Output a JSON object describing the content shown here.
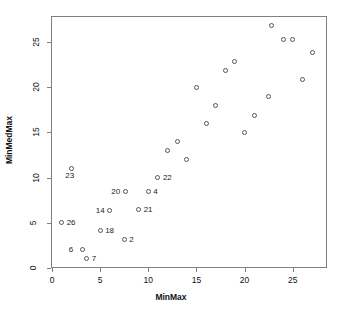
{
  "chart_data": {
    "type": "scatter",
    "title": "",
    "xlabel": "MinMax",
    "ylabel": "MinMedMax",
    "xlim": [
      -0.4,
      28.3
    ],
    "ylim": [
      -0.5,
      27.5
    ],
    "xticks": [
      0,
      5,
      10,
      15,
      20,
      25
    ],
    "yticks": [
      0,
      5,
      10,
      15,
      20,
      25
    ],
    "grid": false,
    "legend": null,
    "marker": "open-circle",
    "points": [
      {
        "x": 1.0,
        "y": 5.0,
        "label": "26",
        "label_pos": "right"
      },
      {
        "x": 2.0,
        "y": 11.0,
        "label": "23",
        "label_pos": "below"
      },
      {
        "x": 3.2,
        "y": 2.0,
        "label": "6",
        "label_pos": "left"
      },
      {
        "x": 3.6,
        "y": 1.0,
        "label": "7",
        "label_pos": "right"
      },
      {
        "x": 5.0,
        "y": 4.1,
        "label": "18",
        "label_pos": "right"
      },
      {
        "x": 6.0,
        "y": 6.4,
        "label": "14",
        "label_pos": "left"
      },
      {
        "x": 7.5,
        "y": 3.1,
        "label": "2",
        "label_pos": "right"
      },
      {
        "x": 7.6,
        "y": 8.4,
        "label": "20",
        "label_pos": "left"
      },
      {
        "x": 9.0,
        "y": 6.5,
        "label": "21",
        "label_pos": "right"
      },
      {
        "x": 10.0,
        "y": 8.4,
        "label": "4",
        "label_pos": "right"
      },
      {
        "x": 11.0,
        "y": 10.0,
        "label": "22",
        "label_pos": "right"
      },
      {
        "x": 12.0,
        "y": 13.0,
        "label": "",
        "label_pos": "right"
      },
      {
        "x": 13.0,
        "y": 14.0,
        "label": "",
        "label_pos": "right"
      },
      {
        "x": 14.0,
        "y": 12.0,
        "label": "",
        "label_pos": "right"
      },
      {
        "x": 15.0,
        "y": 20.0,
        "label": "",
        "label_pos": "right"
      },
      {
        "x": 16.0,
        "y": 16.0,
        "label": "",
        "label_pos": "right"
      },
      {
        "x": 17.0,
        "y": 18.0,
        "label": "",
        "label_pos": "right"
      },
      {
        "x": 18.0,
        "y": 21.8,
        "label": "",
        "label_pos": "right"
      },
      {
        "x": 19.0,
        "y": 22.8,
        "label": "",
        "label_pos": "right"
      },
      {
        "x": 20.0,
        "y": 15.0,
        "label": "",
        "label_pos": "right"
      },
      {
        "x": 21.0,
        "y": 16.8,
        "label": "",
        "label_pos": "right"
      },
      {
        "x": 22.5,
        "y": 19.0,
        "label": "",
        "label_pos": "right"
      },
      {
        "x": 22.8,
        "y": 26.8,
        "label": "",
        "label_pos": "right"
      },
      {
        "x": 24.0,
        "y": 25.3,
        "label": "",
        "label_pos": "right"
      },
      {
        "x": 25.0,
        "y": 25.3,
        "label": "",
        "label_pos": "right"
      },
      {
        "x": 26.0,
        "y": 20.8,
        "label": "",
        "label_pos": "right"
      },
      {
        "x": 27.0,
        "y": 23.8,
        "label": "",
        "label_pos": "right"
      }
    ]
  },
  "colors": {
    "frame": "#808080",
    "marker": "#555555",
    "text": "#111111",
    "background": "#ffffff"
  }
}
